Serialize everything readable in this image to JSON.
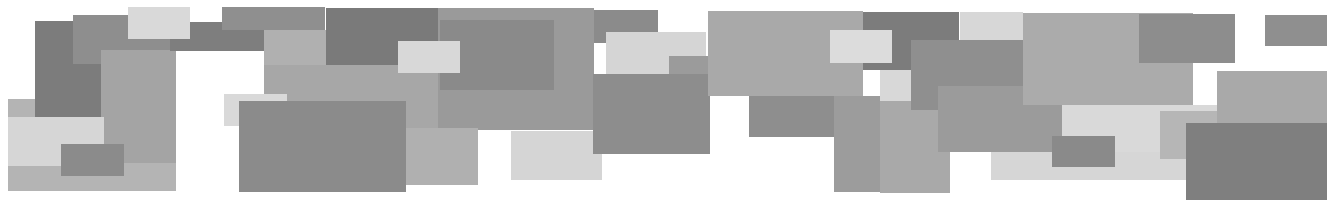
{
  "artwork": {
    "description": "Abstract composition of overlapping grayscale rectangles",
    "background": "#ffffff",
    "rects": [
      {
        "x": 8,
        "y": 99,
        "w": 168,
        "h": 92,
        "c": "#b4b4b4"
      },
      {
        "x": 35,
        "y": 21,
        "w": 66,
        "h": 96,
        "c": "#7c7c7c"
      },
      {
        "x": 73,
        "y": 15,
        "w": 97,
        "h": 49,
        "c": "#8e8e8e"
      },
      {
        "x": 101,
        "y": 50,
        "w": 75,
        "h": 113,
        "c": "#a4a4a4"
      },
      {
        "x": 170,
        "y": 22,
        "w": 120,
        "h": 29,
        "c": "#7e7e7e"
      },
      {
        "x": 222,
        "y": 7,
        "w": 103,
        "h": 23,
        "c": "#8f8f8f"
      },
      {
        "x": 264,
        "y": 30,
        "w": 62,
        "h": 65,
        "c": "#b0b0b0"
      },
      {
        "x": 326,
        "y": 8,
        "w": 112,
        "h": 57,
        "c": "#7a7a7a"
      },
      {
        "x": 264,
        "y": 65,
        "w": 190,
        "h": 65,
        "c": "#a7a7a7"
      },
      {
        "x": 438,
        "y": 8,
        "w": 156,
        "h": 122,
        "c": "#9a9a9a"
      },
      {
        "x": 440,
        "y": 20,
        "w": 114,
        "h": 70,
        "c": "#8a8a8a"
      },
      {
        "x": 398,
        "y": 41,
        "w": 62,
        "h": 32,
        "c": "#d8d8d8"
      },
      {
        "x": 128,
        "y": 7,
        "w": 62,
        "h": 32,
        "c": "#d9d9d9"
      },
      {
        "x": 8,
        "y": 117,
        "w": 96,
        "h": 49,
        "c": "#d6d6d6"
      },
      {
        "x": 61,
        "y": 144,
        "w": 63,
        "h": 32,
        "c": "#8b8b8b"
      },
      {
        "x": 224,
        "y": 94,
        "w": 63,
        "h": 32,
        "c": "#d9d9d9"
      },
      {
        "x": 239,
        "y": 101,
        "w": 167,
        "h": 91,
        "c": "#8b8b8b"
      },
      {
        "x": 406,
        "y": 128,
        "w": 72,
        "h": 57,
        "c": "#b0b0b0"
      },
      {
        "x": 511,
        "y": 131,
        "w": 91,
        "h": 49,
        "c": "#d5d5d5"
      },
      {
        "x": 594,
        "y": 10,
        "w": 64,
        "h": 33,
        "c": "#8b8b8b"
      },
      {
        "x": 606,
        "y": 32,
        "w": 100,
        "h": 42,
        "c": "#d5d5d5"
      },
      {
        "x": 669,
        "y": 56,
        "w": 40,
        "h": 20,
        "c": "#9b9b9b"
      },
      {
        "x": 593,
        "y": 74,
        "w": 117,
        "h": 80,
        "c": "#8d8d8d"
      },
      {
        "x": 708,
        "y": 11,
        "w": 155,
        "h": 85,
        "c": "#a9a9a9"
      },
      {
        "x": 749,
        "y": 96,
        "w": 126,
        "h": 41,
        "c": "#8e8e8e"
      },
      {
        "x": 834,
        "y": 96,
        "w": 102,
        "h": 96,
        "c": "#9c9c9c"
      },
      {
        "x": 863,
        "y": 12,
        "w": 96,
        "h": 58,
        "c": "#7c7c7c"
      },
      {
        "x": 830,
        "y": 30,
        "w": 62,
        "h": 33,
        "c": "#dcdcdc"
      },
      {
        "x": 880,
        "y": 70,
        "w": 52,
        "h": 31,
        "c": "#d8d8d8"
      },
      {
        "x": 880,
        "y": 101,
        "w": 70,
        "h": 92,
        "c": "#a9a9a9"
      },
      {
        "x": 960,
        "y": 12,
        "w": 63,
        "h": 28,
        "c": "#d7d7d7"
      },
      {
        "x": 911,
        "y": 40,
        "w": 112,
        "h": 70,
        "c": "#8f8f8f"
      },
      {
        "x": 938,
        "y": 86,
        "w": 124,
        "h": 66,
        "c": "#9b9b9b"
      },
      {
        "x": 1023,
        "y": 13,
        "w": 170,
        "h": 92,
        "c": "#ababab"
      },
      {
        "x": 991,
        "y": 152,
        "w": 200,
        "h": 28,
        "c": "#d6d6d6"
      },
      {
        "x": 1062,
        "y": 105,
        "w": 155,
        "h": 47,
        "c": "#d9d9d9"
      },
      {
        "x": 1052,
        "y": 136,
        "w": 63,
        "h": 31,
        "c": "#8a8a8a"
      },
      {
        "x": 1139,
        "y": 14,
        "w": 96,
        "h": 49,
        "c": "#8d8d8d"
      },
      {
        "x": 1160,
        "y": 111,
        "w": 60,
        "h": 48,
        "c": "#b6b6b6"
      },
      {
        "x": 1217,
        "y": 71,
        "w": 110,
        "h": 52,
        "c": "#a9a9a9"
      },
      {
        "x": 1186,
        "y": 123,
        "w": 141,
        "h": 77,
        "c": "#7f7f7f"
      },
      {
        "x": 1265,
        "y": 15,
        "w": 62,
        "h": 31,
        "c": "#8f8f8f"
      }
    ]
  }
}
